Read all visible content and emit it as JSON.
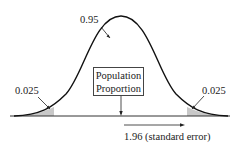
{
  "diagram": {
    "type": "normal-distribution-confidence-interval",
    "center_label_line1": "Population",
    "center_label_line2": "Proportion",
    "middle_area": "0.95",
    "left_tail_area": "0.025",
    "right_tail_area": "0.025",
    "distance_label": "1.96 (standard error)",
    "colors": {
      "curve": "#111111",
      "tail_shade": "#c8c8c8",
      "axis": "#333333"
    }
  }
}
